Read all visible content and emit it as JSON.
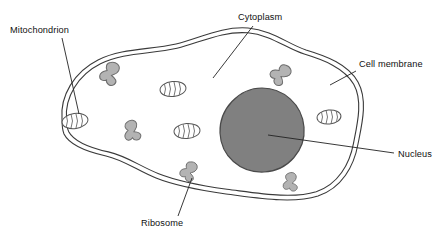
{
  "diagram": {
    "type": "labeled-biological-diagram",
    "canvas": {
      "width": 448,
      "height": 238
    },
    "background_color": "#ffffff",
    "line_color": "#3a3a3a",
    "colors": {
      "outline": "#3a3a3a",
      "nucleus_fill": "#808080",
      "nucleus_stroke": "#4a4a4a",
      "ribosome_fill": "#b3b3b3",
      "ribosome_stroke": "#6e6e6e",
      "mitochondrion_fill": "#ffffff",
      "mitochondrion_stroke": "#555555",
      "label_text": "#111111",
      "leader_line": "#222222"
    },
    "labels": [
      {
        "id": "mitochondrion",
        "text": "Mitochondrion",
        "x": 10,
        "y": 33,
        "anchor": "start"
      },
      {
        "id": "cytoplasm",
        "text": "Cytoplasm",
        "x": 238,
        "y": 20,
        "anchor": "start"
      },
      {
        "id": "cell-membrane",
        "text": "Cell membrane",
        "x": 359,
        "y": 67,
        "anchor": "start"
      },
      {
        "id": "nucleus",
        "text": "Nucleus",
        "x": 398,
        "y": 157,
        "anchor": "start"
      },
      {
        "id": "ribosome",
        "text": "Ribosome",
        "x": 141,
        "y": 226,
        "anchor": "start"
      }
    ],
    "structures": {
      "cell_membrane": {
        "name": "cell membrane",
        "style": "double line",
        "gap_px": 4
      },
      "nucleus": {
        "name": "nucleus",
        "shape": "circle",
        "cx": 262,
        "cy": 130,
        "r": 42
      },
      "mitochondria": [
        {
          "cx": 75,
          "cy": 121,
          "rx": 13,
          "ry": 7.5,
          "rotate": -8
        },
        {
          "cx": 173,
          "cy": 89,
          "rx": 13,
          "ry": 7.5,
          "rotate": -6
        },
        {
          "cx": 187,
          "cy": 131,
          "rx": 13,
          "ry": 7.5,
          "rotate": -4
        },
        {
          "cx": 329,
          "cy": 117,
          "rx": 12,
          "ry": 7,
          "rotate": -6
        }
      ],
      "ribosomes": [
        {
          "cx": 110,
          "cy": 72,
          "scale": 1.05,
          "rotate": 10
        },
        {
          "cx": 131,
          "cy": 130,
          "scale": 0.95,
          "rotate": -25
        },
        {
          "cx": 281,
          "cy": 73,
          "scale": 1.0,
          "rotate": 35
        },
        {
          "cx": 189,
          "cy": 170,
          "scale": 0.9,
          "rotate": 15
        },
        {
          "cx": 290,
          "cy": 181,
          "scale": 0.85,
          "rotate": -10
        }
      ]
    },
    "leader_lines": [
      {
        "for": "mitochondrion",
        "from": [
          62,
          38
        ],
        "to": [
          79,
          114
        ]
      },
      {
        "for": "cytoplasm",
        "from": [
          253,
          26
        ],
        "to": [
          213,
          78
        ]
      },
      {
        "for": "cell-membrane",
        "from": [
          356,
          71
        ],
        "to": [
          330,
          85
        ]
      },
      {
        "for": "nucleus",
        "from": [
          394,
          153
        ],
        "to": [
          268,
          135
        ]
      },
      {
        "for": "ribosome",
        "from": [
          178,
          216
        ],
        "to": [
          192,
          178
        ]
      }
    ]
  }
}
